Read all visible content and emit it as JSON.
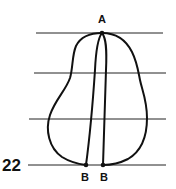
{
  "diagram": {
    "stroke_color": "#111111",
    "background": "#ffffff",
    "horizontal_lines": [
      {
        "y": 33,
        "x1": 36,
        "x2": 163
      },
      {
        "y": 73,
        "x1": 34,
        "x2": 166
      },
      {
        "y": 119,
        "x1": 29,
        "x2": 166
      },
      {
        "y": 165,
        "x1": 28,
        "x2": 166
      }
    ],
    "points": {
      "A": {
        "label": "A",
        "x": 102,
        "y": 33
      },
      "B_left": {
        "label": "B",
        "x": 86,
        "y": 165
      },
      "B_right": {
        "label": "B",
        "x": 103,
        "y": 165
      }
    },
    "level_label": "22"
  }
}
